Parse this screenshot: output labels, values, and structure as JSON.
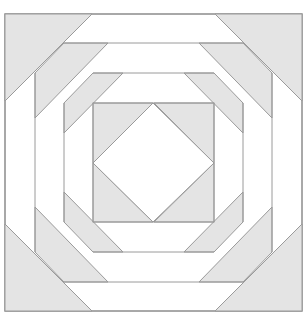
{
  "figure": {
    "title": "Pineapple quilt block diagram",
    "colors": {
      "background": "#ffffff",
      "shaded": "#e4e4e4",
      "line": "#9a9a9a",
      "outer_border": "#8c8c8c"
    }
  }
}
